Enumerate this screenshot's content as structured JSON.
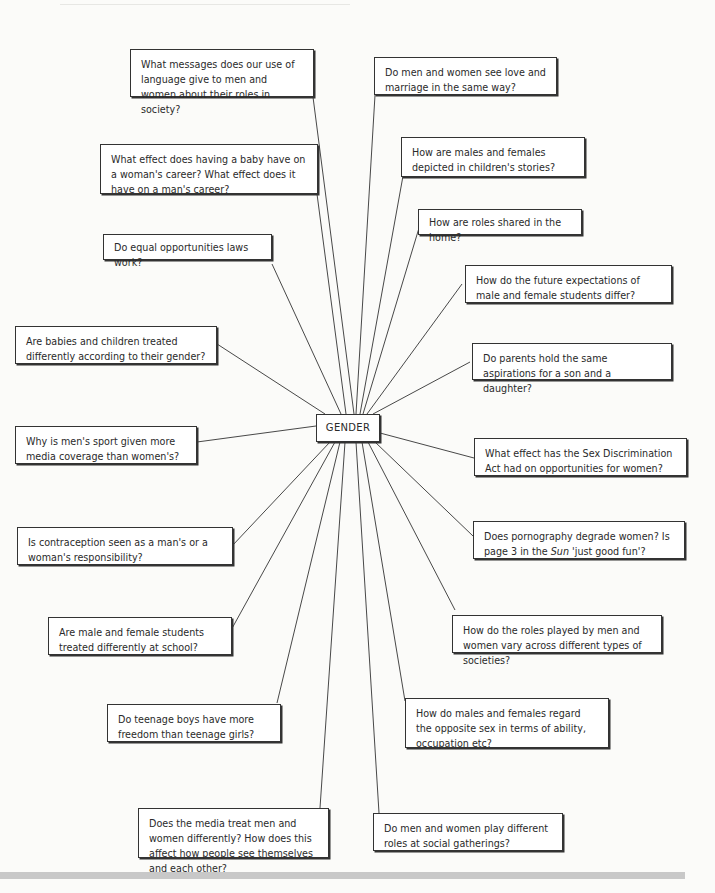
{
  "diagram": {
    "type": "spider-diagram",
    "center": {
      "label": "GENDER"
    },
    "nodes": [
      {
        "id": "n1",
        "text": "What messages does our use of language give to men and women about their roles in society?"
      },
      {
        "id": "n2",
        "text": "Do men and women see love and marriage in the same way?"
      },
      {
        "id": "n3",
        "text": "What effect does having a baby have on a woman's career? What effect does it have on a man's career?"
      },
      {
        "id": "n4",
        "text": "How are males and females depicted in children's stories?"
      },
      {
        "id": "n5",
        "text": "How are roles shared in the home?"
      },
      {
        "id": "n6",
        "text": "Do equal opportunities laws work?"
      },
      {
        "id": "n7",
        "text": "How do the future expectations of male and female students differ?"
      },
      {
        "id": "n8",
        "text": "Are babies and children treated differently according to their gender?"
      },
      {
        "id": "n9",
        "text": "Do parents hold the same aspirations for a son and a daughter?"
      },
      {
        "id": "n10",
        "text": "Why is men's sport given more media coverage than women's?"
      },
      {
        "id": "n11",
        "text": "What effect has the Sex Discrimination Act had on opportunities for women?"
      },
      {
        "id": "n12",
        "text": "Is contraception seen as a man's or a woman's responsibility?"
      },
      {
        "id": "n13",
        "text_pre": "Does pornography degrade women? Is page 3 in the ",
        "text_italic": "Sun",
        "text_post": " 'just good fun'?"
      },
      {
        "id": "n14",
        "text": "Are male and female students treated differently at school?"
      },
      {
        "id": "n15",
        "text": "How do the roles played by men and women vary across different types of societies?"
      },
      {
        "id": "n16",
        "text": "Do teenage boys have more freedom than teenage girls?"
      },
      {
        "id": "n17",
        "text": "How do males and females regard the opposite sex in terms of ability, occupation etc?"
      },
      {
        "id": "n18",
        "text": "Does the media treat men and women differently? How does this affect how people see themselves and each other?"
      },
      {
        "id": "n19",
        "text": "Do men and women play different roles at social gatherings?"
      }
    ],
    "colors": {
      "line": "#333333",
      "box_border": "#333333",
      "background": "#fbfbf9",
      "footer_bar": "#c8c8c8"
    }
  }
}
